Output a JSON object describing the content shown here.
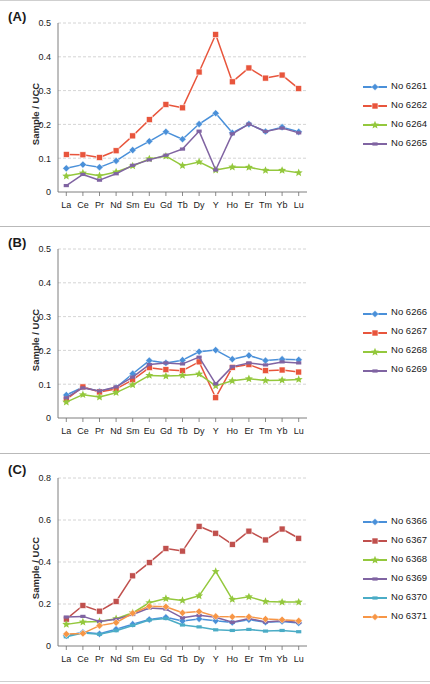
{
  "figure": {
    "background": "#ffffff",
    "axis_label": "Sample / UCC",
    "panels": [
      {
        "tag": "(A)",
        "y_ticks": [
          "0",
          "0.1",
          "0.2",
          "0.3",
          "0.4",
          "0.5"
        ]
      },
      {
        "tag": "(B)",
        "y_ticks": [
          "0",
          "0.1",
          "0.2",
          "0.3",
          "0.4",
          "0.5"
        ]
      },
      {
        "tag": "(C)",
        "y_ticks": [
          "0",
          "0.2",
          "0.4",
          "0.6",
          "0.8"
        ]
      }
    ]
  },
  "colors": {
    "blue": "#4A90D9",
    "red": "#E8553C",
    "green": "#94C83D",
    "purple": "#8064A2",
    "cyan": "#4BACC6",
    "orange": "#F79646",
    "gridline": "#c9c9c9",
    "axis": "#6f6f6f",
    "text": "#1a1a1a"
  },
  "chart_data": [
    {
      "type": "line",
      "panel": "(A)",
      "title": "(A)",
      "xlabel": "",
      "ylabel": "Sample / UCC",
      "categories": [
        "La",
        "Ce",
        "Pr",
        "Nd",
        "Sm",
        "Eu",
        "Gd",
        "Tb",
        "Dy",
        "Y",
        "Ho",
        "Er",
        "Tm",
        "Yb",
        "Lu"
      ],
      "ylim": [
        0,
        0.5
      ],
      "yticks": [
        0,
        0.1,
        0.2,
        0.3,
        0.4,
        0.5
      ],
      "grid": true,
      "legend_position": "right",
      "series": [
        {
          "name": "No 6261",
          "color": "#4A90D9",
          "marker": "diamond",
          "values": [
            0.07,
            0.081,
            0.073,
            0.092,
            0.124,
            0.15,
            0.178,
            0.156,
            0.201,
            0.233,
            0.175,
            0.201,
            0.179,
            0.192,
            0.178
          ]
        },
        {
          "name": "No 6262",
          "color": "#E8553C",
          "marker": "square",
          "values": [
            0.111,
            0.11,
            0.102,
            0.122,
            0.166,
            0.214,
            0.259,
            0.249,
            0.355,
            0.466,
            0.326,
            0.367,
            0.337,
            0.346,
            0.306
          ]
        },
        {
          "name": "No 6264",
          "color": "#94C83D",
          "marker": "star",
          "values": [
            0.047,
            0.056,
            0.048,
            0.059,
            0.077,
            0.098,
            0.106,
            0.078,
            0.089,
            0.065,
            0.074,
            0.073,
            0.064,
            0.064,
            0.057
          ]
        },
        {
          "name": "No 6265",
          "color": "#8064A2",
          "marker": "line",
          "values": [
            0.019,
            0.052,
            0.035,
            0.054,
            0.079,
            0.095,
            0.109,
            0.127,
            0.18,
            0.065,
            0.172,
            0.201,
            0.179,
            0.189,
            0.175
          ]
        }
      ]
    },
    {
      "type": "line",
      "panel": "(B)",
      "title": "(B)",
      "xlabel": "",
      "ylabel": "Sample / UCC",
      "categories": [
        "La",
        "Ce",
        "Pr",
        "Nd",
        "Sm",
        "Eu",
        "Gd",
        "Tb",
        "Dy",
        "Y",
        "Ho",
        "Er",
        "Tm",
        "Yb",
        "Lu"
      ],
      "ylim": [
        0,
        0.5
      ],
      "yticks": [
        0,
        0.1,
        0.2,
        0.3,
        0.4,
        0.5
      ],
      "grid": true,
      "legend_position": "right",
      "series": [
        {
          "name": "No 6266",
          "color": "#4A90D9",
          "marker": "diamond",
          "values": [
            0.068,
            0.091,
            0.079,
            0.09,
            0.131,
            0.17,
            0.163,
            0.171,
            0.196,
            0.201,
            0.174,
            0.185,
            0.17,
            0.174,
            0.172
          ]
        },
        {
          "name": "No 6267",
          "color": "#E8553C",
          "marker": "square",
          "values": [
            0.055,
            0.092,
            0.077,
            0.086,
            0.113,
            0.149,
            0.143,
            0.14,
            0.166,
            0.06,
            0.15,
            0.158,
            0.14,
            0.142,
            0.136
          ]
        },
        {
          "name": "No 6268",
          "color": "#94C83D",
          "marker": "star",
          "values": [
            0.047,
            0.069,
            0.062,
            0.075,
            0.098,
            0.126,
            0.124,
            0.126,
            0.13,
            0.095,
            0.11,
            0.116,
            0.111,
            0.112,
            0.114
          ]
        },
        {
          "name": "No 6269",
          "color": "#8064A2",
          "marker": "line",
          "values": [
            0.06,
            0.089,
            0.08,
            0.092,
            0.121,
            0.158,
            0.163,
            0.16,
            0.18,
            0.101,
            0.152,
            0.163,
            0.157,
            0.166,
            0.163
          ]
        }
      ]
    },
    {
      "type": "line",
      "panel": "(C)",
      "title": "(C)",
      "xlabel": "",
      "ylabel": "Sample / UCC",
      "categories": [
        "La",
        "Ce",
        "Pr",
        "Nd",
        "Sm",
        "Eu",
        "Gd",
        "Tb",
        "Dy",
        "Y",
        "Ho",
        "Er",
        "Tm",
        "Yb",
        "Lu"
      ],
      "ylim": [
        0,
        0.8
      ],
      "yticks": [
        0,
        0.2,
        0.4,
        0.6,
        0.8
      ],
      "grid": true,
      "legend_position": "right",
      "series": [
        {
          "name": "No 6366",
          "color": "#4A90D9",
          "marker": "diamond",
          "values": [
            0.049,
            0.065,
            0.058,
            0.08,
            0.104,
            0.126,
            0.137,
            0.119,
            0.129,
            0.12,
            0.112,
            0.125,
            0.113,
            0.117,
            0.11
          ]
        },
        {
          "name": "No 6367",
          "color": "#C0504D",
          "marker": "square",
          "values": [
            0.128,
            0.193,
            0.166,
            0.212,
            0.334,
            0.397,
            0.464,
            0.452,
            0.57,
            0.537,
            0.484,
            0.547,
            0.505,
            0.557,
            0.513
          ]
        },
        {
          "name": "No 6368",
          "color": "#94C83D",
          "marker": "star",
          "values": [
            0.103,
            0.114,
            0.117,
            0.13,
            0.158,
            0.206,
            0.226,
            0.217,
            0.239,
            0.355,
            0.222,
            0.234,
            0.212,
            0.209,
            0.209
          ]
        },
        {
          "name": "No 6369",
          "color": "#8064A2",
          "marker": "line",
          "values": [
            0.138,
            0.141,
            0.117,
            0.127,
            0.15,
            0.181,
            0.176,
            0.134,
            0.146,
            0.137,
            0.113,
            0.131,
            0.114,
            0.12,
            0.112
          ]
        },
        {
          "name": "No 6370",
          "color": "#4BACC6",
          "marker": "line",
          "values": [
            0.044,
            0.062,
            0.056,
            0.073,
            0.098,
            0.124,
            0.131,
            0.1,
            0.091,
            0.077,
            0.074,
            0.079,
            0.071,
            0.074,
            0.068
          ]
        },
        {
          "name": "No 6371",
          "color": "#F79646",
          "marker": "diamond",
          "values": [
            0.057,
            0.06,
            0.097,
            0.111,
            0.156,
            0.189,
            0.187,
            0.158,
            0.164,
            0.141,
            0.139,
            0.139,
            0.128,
            0.125,
            0.12
          ]
        }
      ]
    }
  ]
}
